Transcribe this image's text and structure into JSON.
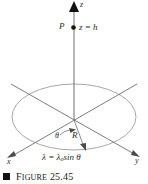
{
  "figure": {
    "caption_marker": "square-bullet",
    "caption_word": "F",
    "caption_word_rest": "IGURE",
    "caption_number": "25.45",
    "caption_full": "FIGURE 25.45"
  },
  "labels": {
    "z_axis": "z",
    "point_p": "P",
    "z_equals_h": "z = h",
    "theta": "θ",
    "radius": "R",
    "lambda_equation_head": "λ = λ",
    "lambda_equation_sub": "o",
    "lambda_equation_tail": "sin θ",
    "lambda_equation_full": "λ = λosin θ",
    "x_axis": "x",
    "y_axis": "y"
  },
  "colors": {
    "axis": "#6e6e6e",
    "ellipse": "#9a9a9a",
    "ink": "#2b2b2b",
    "caption": "#1a1a1a",
    "background": "#ffffff"
  },
  "geometry": {
    "origin": [
      74,
      120
    ],
    "z_axis_top": [
      74,
      6
    ],
    "point_p": [
      73,
      27
    ],
    "ring_center": [
      74,
      117
    ],
    "ring_rx": 62,
    "ring_ry": 33,
    "x_axis_arrow": [
      8,
      157
    ],
    "y_axis_arrow": [
      139,
      156
    ],
    "radius_arrow_end": [
      86,
      147
    ]
  }
}
